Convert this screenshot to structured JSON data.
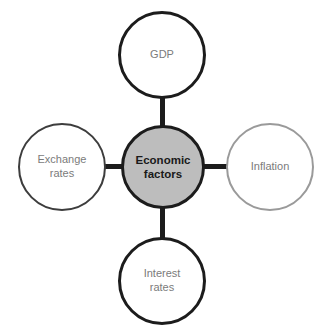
{
  "diagram": {
    "type": "hub-and-spoke",
    "title": "Economic factors",
    "center": {
      "label": "Economic\nfactors",
      "fill_color": "#bdbdbd",
      "stroke_color": "#1c1c1c",
      "text_color": "#1a1a1a"
    },
    "nodes": [
      {
        "id": "gdp",
        "label": "GDP",
        "position": "top",
        "fill_color": "#ffffff",
        "stroke_color": "#1c1c1c",
        "text_color": "#7b7b7b"
      },
      {
        "id": "exchange-rates",
        "label": "Exchange\nrates",
        "position": "left",
        "fill_color": "#ffffff",
        "stroke_color": "#3d3d3d",
        "text_color": "#7b7b7b"
      },
      {
        "id": "inflation",
        "label": "Inflation",
        "position": "right",
        "fill_color": "#ffffff",
        "stroke_color": "#9a9a9a",
        "text_color": "#7b7b7b"
      },
      {
        "id": "interest-rates",
        "label": "Interest\nrates",
        "position": "bottom",
        "fill_color": "#ffffff",
        "stroke_color": "#1c1c1c",
        "text_color": "#7b7b7b"
      }
    ],
    "connectors": [
      {
        "id": "center-to-gdp",
        "orientation": "vertical",
        "color": "#1c1c1c"
      },
      {
        "id": "center-to-exchange-rates",
        "orientation": "horizontal",
        "color": "#1c1c1c"
      },
      {
        "id": "center-to-inflation",
        "orientation": "horizontal",
        "color": "#1c1c1c"
      },
      {
        "id": "center-to-interest-rates",
        "orientation": "vertical",
        "color": "#1c1c1c"
      }
    ]
  }
}
